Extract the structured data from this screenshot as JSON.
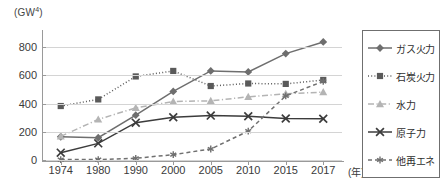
{
  "chart_data": {
    "type": "line",
    "title": "",
    "ylabel": "(GW4)",
    "ylabel_base": "(GW",
    "ylabel_sup": "4",
    "ylabel_tail": ")",
    "xlabel": "(年)",
    "categories": [
      "1974",
      "1980",
      "1990",
      "2000",
      "2005",
      "2010",
      "2015",
      "2017"
    ],
    "ylim": [
      0,
      880
    ],
    "yticks": [
      0,
      200,
      400,
      600,
      800
    ],
    "ytick_labels": [
      "0",
      "200",
      "400",
      "600",
      "800"
    ],
    "grid": true,
    "legend_position": "right",
    "series": [
      {
        "name": "ガス火力",
        "values": [
          165,
          158,
          318,
          487,
          632,
          625,
          755,
          838
        ],
        "color": "#6e6e6e",
        "marker": "diamond",
        "linestyle": "solid"
      },
      {
        "name": "石炭火力",
        "values": [
          383,
          430,
          593,
          632,
          525,
          543,
          540,
          568
        ],
        "color": "#5a5a5a",
        "marker": "square",
        "linestyle": "dotted"
      },
      {
        "name": "水力",
        "values": [
          168,
          288,
          370,
          415,
          420,
          448,
          470,
          482
        ],
        "color": "#b4b4b4",
        "marker": "triangle",
        "linestyle": "dashdot"
      },
      {
        "name": "原子力",
        "values": [
          52,
          118,
          265,
          303,
          315,
          310,
          295,
          293
        ],
        "color": "#3c3c3c",
        "marker": "x",
        "linestyle": "solid"
      },
      {
        "name": "他再エネ",
        "values": [
          3,
          3,
          12,
          38,
          78,
          205,
          455,
          558
        ],
        "color": "#707070",
        "marker": "asterisk",
        "linestyle": "dashed"
      }
    ]
  }
}
